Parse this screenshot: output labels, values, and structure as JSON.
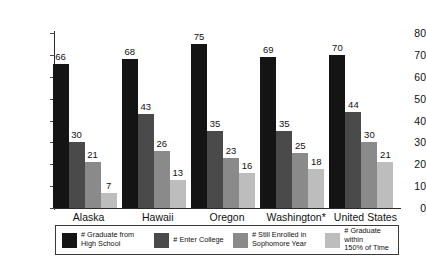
{
  "chart_data": {
    "type": "bar",
    "title": "",
    "subtitle": "",
    "xlabel": "",
    "ylabel": "",
    "ylim": [
      0,
      80
    ],
    "yticks": [
      0,
      10,
      20,
      30,
      40,
      50,
      60,
      70,
      80
    ],
    "grid": false,
    "legend_position": "bottom",
    "categories": [
      "Alaska",
      "Hawaii",
      "Oregon",
      "Washington*",
      "United States"
    ],
    "series": [
      {
        "name": "# Graduate from\nHigh School",
        "color": "#141414",
        "values": [
          66,
          68,
          75,
          69,
          70
        ]
      },
      {
        "name": "# Enter College",
        "color": "#4a4a4a",
        "values": [
          30,
          43,
          35,
          35,
          44
        ]
      },
      {
        "name": "# Still Enrolled in\nSophomore Year",
        "color": "#8a8a8a",
        "values": [
          21,
          26,
          23,
          25,
          30
        ]
      },
      {
        "name": "# Graduate within\n150% of Time",
        "color": "#bdbdbd",
        "values": [
          7,
          13,
          16,
          18,
          21
        ]
      }
    ]
  },
  "legend": {
    "items": [
      {
        "label": "# Graduate from\nHigh School",
        "color": "#141414"
      },
      {
        "label": "# Enter College",
        "color": "#4a4a4a"
      },
      {
        "label": "# Still Enrolled in\nSophomore Year",
        "color": "#8a8a8a"
      },
      {
        "label": "# Graduate within\n150% of Time",
        "color": "#bdbdbd"
      }
    ]
  },
  "axes": {
    "y_tick_labels": [
      "80",
      "70",
      "60",
      "50",
      "40",
      "30",
      "20",
      "10",
      "0"
    ]
  }
}
